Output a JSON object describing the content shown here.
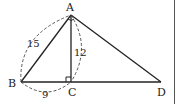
{
  "diagram": {
    "type": "geometry",
    "points": {
      "A": {
        "label": "A",
        "x": 71,
        "y": 15
      },
      "B": {
        "label": "B",
        "x": 21,
        "y": 82
      },
      "C": {
        "label": "C",
        "x": 71,
        "y": 82
      },
      "D": {
        "label": "D",
        "x": 161,
        "y": 82
      }
    },
    "segments": [
      {
        "from": "A",
        "to": "B"
      },
      {
        "from": "A",
        "to": "C"
      },
      {
        "from": "A",
        "to": "D"
      },
      {
        "from": "B",
        "to": "D"
      }
    ],
    "measurements": {
      "AB": "15",
      "AC": "12",
      "BC": "9"
    },
    "right_angle_at": "C",
    "angle_marked_at": "A",
    "colors": {
      "stroke": "#222222",
      "background": "#ffffff"
    }
  }
}
